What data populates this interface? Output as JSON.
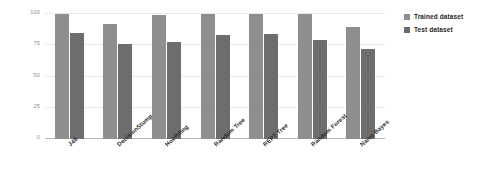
{
  "chart_data": {
    "type": "bar",
    "title": "",
    "subtitle": "",
    "xlabel": "",
    "ylabel": "",
    "ylim": [
      0,
      100
    ],
    "yticks": [
      0,
      25,
      50,
      75,
      100
    ],
    "ytick_labels": [
      "0",
      "25",
      "50",
      "75",
      "100"
    ],
    "grid": true,
    "legend_position": "right",
    "categories": [
      "J48",
      "DecisionStump",
      "Hoeffding",
      "Random Tree",
      "REPT Tree",
      "Random Forest",
      "Naïve Bayes"
    ],
    "series": [
      {
        "name": "Trained dataset",
        "color": "#8e8e8e",
        "values": [
          100,
          92,
          99,
          100,
          100,
          100,
          90
        ]
      },
      {
        "name": "Test dataset",
        "color": "#6d6d6d",
        "values": [
          85,
          76,
          78,
          83,
          84,
          79,
          72
        ]
      }
    ]
  },
  "colors": {
    "background": "#ffffff",
    "gridline": "#e9e9ec",
    "axis": "#b9b9bd",
    "tick_text": "#8a8a8f",
    "label_text": "#2c2c2c",
    "series_trained": "#8e8e8e",
    "series_test": "#6d6d6d"
  }
}
